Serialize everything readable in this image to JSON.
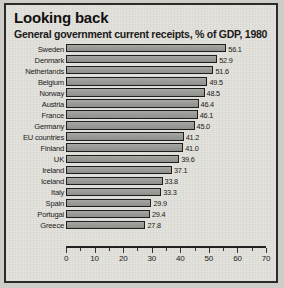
{
  "chart_data": {
    "type": "bar",
    "orientation": "horizontal",
    "title": "Looking back",
    "subtitle": "General government current receipts, % of GDP, 1980",
    "xlabel": "",
    "ylabel": "",
    "xlim": [
      0,
      70
    ],
    "xticks": [
      0,
      10,
      20,
      30,
      40,
      50,
      60,
      70
    ],
    "minor_tick_step": 5,
    "grid": false,
    "legend": null,
    "bar_color": "#9b9b97",
    "bar_edge_color": "#1f1f1f",
    "background_color": "#e3e1db",
    "border_color": "#2b2b2b",
    "categories": [
      "Sweden",
      "Denmark",
      "Netherlands",
      "Belgium",
      "Norway",
      "Austria",
      "France",
      "Germany",
      "EU countries",
      "Finland",
      "UK",
      "Ireland",
      "Iceland",
      "Italy",
      "Spain",
      "Portugal",
      "Greece"
    ],
    "values": [
      56.1,
      52.9,
      51.6,
      49.5,
      48.5,
      46.4,
      46.1,
      45.0,
      41.2,
      41.0,
      39.6,
      37.1,
      33.8,
      33.3,
      29.9,
      29.4,
      27.8
    ],
    "value_labels": [
      "56.1",
      "52.9",
      "51.6",
      "49.5",
      "48.5",
      "46.4",
      "46.1",
      "45.0",
      "41.2",
      "41.0",
      "39.6",
      "37.1",
      "33.8",
      "33.3",
      "29.9",
      "29.4",
      "27.8"
    ],
    "tick_labels": [
      "0",
      "10",
      "20",
      "30",
      "40",
      "50",
      "60",
      "70"
    ]
  }
}
